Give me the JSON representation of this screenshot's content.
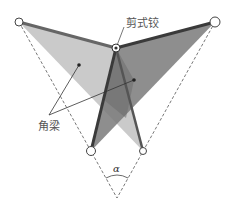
{
  "diagram": {
    "labels": {
      "hinge": "剪式铰",
      "beams": "角梁",
      "angle": "α"
    },
    "colors": {
      "light_panel": "#bdbdbd",
      "dark_panel": "#6e6e6e",
      "mid_panel": "#8a8a8a",
      "beam_dark": "#3a3a3a",
      "beam_mid": "#666666",
      "guide_line": "#555555",
      "text": "#555555"
    },
    "points": {
      "top_left": [
        19,
        22
      ],
      "top_right": [
        215,
        22
      ],
      "hinge": [
        116,
        48
      ],
      "bottom_left": [
        91,
        151
      ],
      "bottom_right": [
        143,
        151
      ],
      "apex": [
        117,
        198
      ]
    }
  }
}
